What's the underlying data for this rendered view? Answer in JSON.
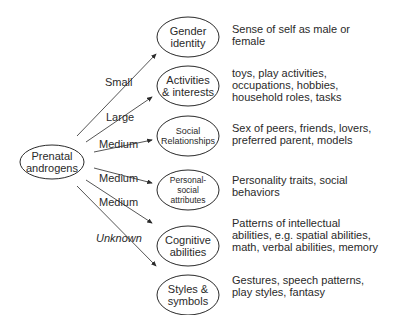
{
  "source": {
    "label_1": "Prenatal",
    "label_2": "androgens"
  },
  "targets": [
    {
      "label_1": "Gender",
      "label_2": "identity",
      "effect": "Small",
      "description": "Sense of self as male or\nfemale"
    },
    {
      "label_1": "Activities",
      "label_2": "& interests",
      "effect": "Large",
      "description": "toys, play activities,\noccupations, hobbies,\nhousehold roles, tasks"
    },
    {
      "label_1": "Social",
      "label_2": "Relationships",
      "effect": "Medium",
      "description": "Sex of peers, friends, lovers,\npreferred parent, models"
    },
    {
      "label_1": "Personal-",
      "label_2": "social",
      "label_3": "attributes",
      "effect": "Medium",
      "description": "Personality traits, social\nbehaviors"
    },
    {
      "label_1": "Cognitive",
      "label_2": "abilities",
      "effect": "Medium",
      "description": "Patterns of intellectual\nabilities, e.g. spatial abilities,\nmath, verbal abilities, memory"
    },
    {
      "label_1": "Styles &",
      "label_2": "symbols",
      "effect": "Unknown",
      "description": "Gestures, speech patterns,\nplay styles, fantasy"
    }
  ],
  "colors": {
    "line": "#2a2a2a",
    "text": "#2a2a2a",
    "background": "#ffffff"
  }
}
